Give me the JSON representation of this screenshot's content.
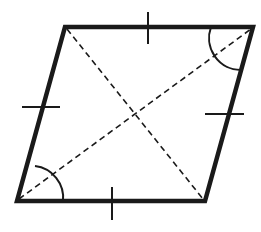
{
  "figure": {
    "shape": "rhombus",
    "vertices": {
      "top_left": [
        65,
        27
      ],
      "top_right": [
        253,
        27
      ],
      "bottom_right": [
        205,
        201
      ],
      "bottom_left": [
        17,
        201
      ]
    },
    "diagonals": [
      "top_left-bottom_right",
      "bottom_left-top_right"
    ],
    "congruent_side_ticks": 4,
    "marked_angles": [
      "top_right",
      "bottom_left"
    ],
    "colors": {
      "stroke": "#1a1a1a",
      "background": "#ffffff"
    }
  }
}
